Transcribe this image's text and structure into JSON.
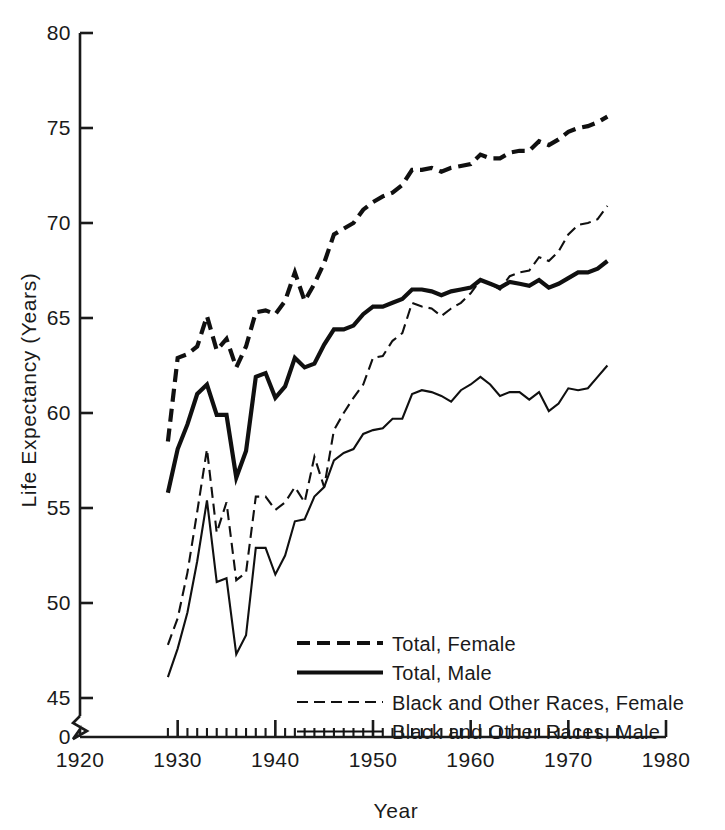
{
  "chart_data": {
    "type": "line",
    "title": "",
    "xlabel": "Year",
    "ylabel": "Life Expectancy (Years)",
    "xlim": [
      1920,
      1980
    ],
    "ylim": [
      45,
      80
    ],
    "y_axis_break": true,
    "y_break_labels": [
      "0",
      "45"
    ],
    "grid": false,
    "legend_position": "lower-center-right",
    "xticks": [
      1920,
      1930,
      1940,
      1950,
      1960,
      1970,
      1980
    ],
    "xtick_labels": [
      "1920",
      "1930",
      "1940",
      "1950",
      "1960",
      "1970",
      "1980"
    ],
    "yticks": [
      45,
      50,
      55,
      60,
      65,
      70,
      75,
      80
    ],
    "ytick_labels": [
      "45",
      "50",
      "55",
      "60",
      "65",
      "70",
      "75",
      "80"
    ],
    "minor_xtick_start": 1929,
    "minor_xtick_end": 1975,
    "x": [
      1929,
      1930,
      1931,
      1932,
      1933,
      1934,
      1935,
      1936,
      1937,
      1938,
      1939,
      1940,
      1941,
      1942,
      1943,
      1944,
      1945,
      1946,
      1947,
      1948,
      1949,
      1950,
      1951,
      1952,
      1953,
      1954,
      1955,
      1956,
      1957,
      1958,
      1959,
      1960,
      1961,
      1962,
      1963,
      1964,
      1965,
      1966,
      1967,
      1968,
      1969,
      1970,
      1971,
      1972,
      1973,
      1974
    ],
    "series": [
      {
        "name": "Total, Female",
        "style": "thick-dashed",
        "linewidth": 4.2,
        "dash": "13,7",
        "color": "#101010",
        "x_start": 1929,
        "values": [
          58.5,
          62.9,
          63.1,
          63.5,
          65.1,
          63.3,
          63.9,
          62.4,
          63.5,
          65.3,
          65.4,
          65.2,
          65.9,
          67.4,
          65.9,
          66.8,
          67.9,
          69.4,
          69.7,
          70.0,
          70.7,
          71.1,
          71.4,
          71.6,
          72.0,
          72.8,
          72.8,
          72.9,
          72.7,
          72.9,
          73.0,
          73.1,
          73.6,
          73.4,
          73.4,
          73.7,
          73.8,
          73.8,
          74.3,
          74.1,
          74.4,
          74.8,
          75.0,
          75.1,
          75.3,
          75.6
        ]
      },
      {
        "name": "Total, Male",
        "style": "thick-solid",
        "linewidth": 4.2,
        "dash": "none",
        "color": "#101010",
        "x_start": 1929,
        "values": [
          55.8,
          58.1,
          59.4,
          61.0,
          61.5,
          59.9,
          59.9,
          56.6,
          58.0,
          61.9,
          62.1,
          60.8,
          61.4,
          62.9,
          62.4,
          62.6,
          63.6,
          64.4,
          64.4,
          64.6,
          65.2,
          65.6,
          65.6,
          65.8,
          66.0,
          66.5,
          66.5,
          66.4,
          66.2,
          66.4,
          66.5,
          66.6,
          67.0,
          66.8,
          66.6,
          66.9,
          66.8,
          66.7,
          67.0,
          66.6,
          66.8,
          67.1,
          67.4,
          67.4,
          67.6,
          68.0
        ]
      },
      {
        "name": "Black and Other Races, Female",
        "style": "thin-dashed",
        "linewidth": 2.1,
        "dash": "11,6",
        "color": "#101010",
        "x_start": 1929,
        "values": [
          47.8,
          49.2,
          51.6,
          54.8,
          58.1,
          53.7,
          55.3,
          51.2,
          51.6,
          55.6,
          55.6,
          54.9,
          55.3,
          56.1,
          55.3,
          57.7,
          56.1,
          59.1,
          60.0,
          60.8,
          61.5,
          62.9,
          63.0,
          63.8,
          64.2,
          65.8,
          65.6,
          65.5,
          65.1,
          65.5,
          65.8,
          66.3,
          67.0,
          66.8,
          66.5,
          67.2,
          67.4,
          67.5,
          68.2,
          68.0,
          68.5,
          69.4,
          69.9,
          70.0,
          70.2,
          70.9
        ]
      },
      {
        "name": "Black and Other Races, Male",
        "style": "thin-solid",
        "linewidth": 2.1,
        "dash": "none",
        "color": "#101010",
        "x_start": 1929,
        "values": [
          46.1,
          47.6,
          49.5,
          52.2,
          55.4,
          51.1,
          51.3,
          47.3,
          48.3,
          52.9,
          52.9,
          51.5,
          52.5,
          54.3,
          54.4,
          55.6,
          56.1,
          57.5,
          57.9,
          58.1,
          58.9,
          59.1,
          59.2,
          59.7,
          59.7,
          61.0,
          61.2,
          61.1,
          60.9,
          60.6,
          61.2,
          61.5,
          61.9,
          61.5,
          60.9,
          61.1,
          61.1,
          60.7,
          61.1,
          60.1,
          60.5,
          61.3,
          61.2,
          61.3,
          61.9,
          62.5
        ]
      }
    ]
  },
  "legend": {
    "items": [
      {
        "label": "Total, Female"
      },
      {
        "label": "Total, Male"
      },
      {
        "label": "Black and Other Races, Female"
      },
      {
        "label": "Black and Other Races, Male"
      }
    ]
  },
  "axes": {
    "y_title": "Life Expectancy (Years)",
    "x_title": "Year",
    "y_zero_label": "0",
    "y_labels": [
      "80",
      "75",
      "70",
      "65",
      "60",
      "55",
      "50",
      "45"
    ],
    "x_labels": [
      "1920",
      "1930",
      "1940",
      "1950",
      "1960",
      "1970",
      "1980"
    ]
  }
}
